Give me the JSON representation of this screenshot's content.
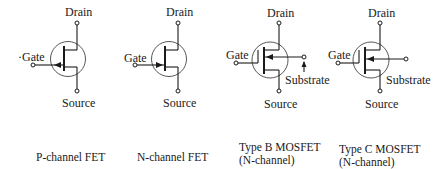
{
  "symbols": [
    {
      "id": "p-channel-fet",
      "caption": "P-channel FET",
      "terminals": {
        "drain": "Drain",
        "gate": "Gate",
        "source": "Source"
      },
      "gate_prefix": "·"
    },
    {
      "id": "n-channel-fet",
      "caption": "N-channel FET",
      "terminals": {
        "drain": "Drain",
        "gate": "Gate",
        "source": "Source"
      }
    },
    {
      "id": "type-b-mosfet",
      "caption_line1": "Type B MOSFET",
      "caption_line2": "(N-channel)",
      "terminals": {
        "drain": "Drain",
        "gate": "Gate",
        "source": "Source",
        "substrate": "Substrate"
      }
    },
    {
      "id": "type-c-mosfet",
      "caption_line1": "Type C MOSFET",
      "caption_line2": "(N-channel)",
      "terminals": {
        "drain": "Drain",
        "gate": "Gate",
        "source": "Source",
        "substrate": "Substrate"
      }
    }
  ],
  "colors": {
    "ink": "#1a1a1a",
    "background": "#ffffff"
  }
}
